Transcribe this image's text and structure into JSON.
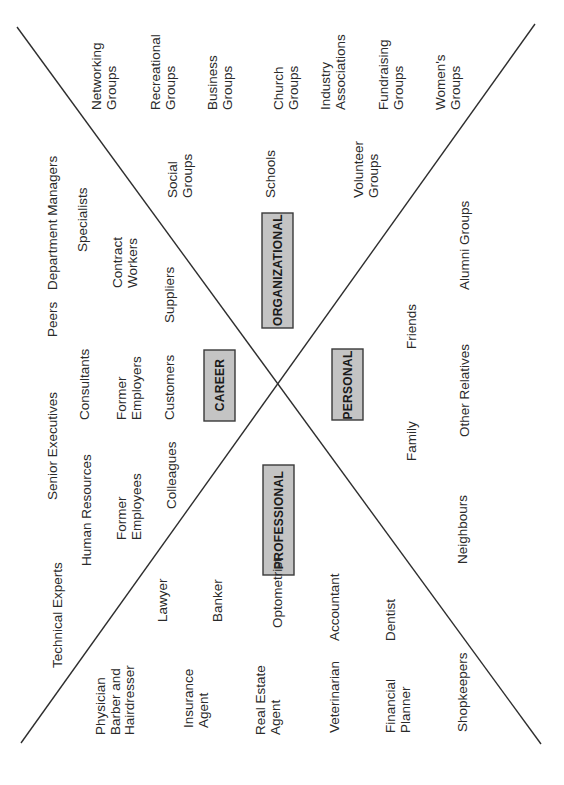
{
  "diagram": {
    "title": "",
    "orientation": "rotated-90-ccw",
    "colors": {
      "line": "#2e2e2e",
      "box_fill": "#c4c4c4",
      "box_stroke": "#3a3a3a",
      "text": "#2a2a2a",
      "background": "#ffffff"
    },
    "categories": {
      "career": "CAREER",
      "organizational": "ORGANIZATIONAL",
      "personal": "PERSONAL",
      "professional": "PROFESSIONAL"
    },
    "career": [
      {
        "lines": [
          "Technical Experts"
        ]
      },
      {
        "lines": [
          "Department Managers"
        ]
      },
      {
        "lines": [
          "Human Resources"
        ]
      },
      {
        "lines": [
          "Senior Executives"
        ]
      },
      {
        "lines": [
          "Peers"
        ]
      },
      {
        "lines": [
          "Specialists"
        ]
      },
      {
        "lines": [
          "Consultants"
        ]
      },
      {
        "lines": [
          "Former",
          "Employers"
        ]
      },
      {
        "lines": [
          "Former",
          "Employees"
        ]
      },
      {
        "lines": [
          "Contract",
          "Workers"
        ]
      },
      {
        "lines": [
          "Colleagues"
        ]
      },
      {
        "lines": [
          "Customers"
        ]
      },
      {
        "lines": [
          "Suppliers"
        ]
      }
    ],
    "organizational": [
      {
        "lines": [
          "Networking",
          "Groups"
        ]
      },
      {
        "lines": [
          "Recreational",
          "Groups"
        ]
      },
      {
        "lines": [
          "Business",
          "Groups"
        ]
      },
      {
        "lines": [
          "Church",
          "Groups"
        ]
      },
      {
        "lines": [
          "Industry",
          "Associations"
        ]
      },
      {
        "lines": [
          "Fundraising",
          "Groups"
        ]
      },
      {
        "lines": [
          "Women's",
          "Groups"
        ]
      },
      {
        "lines": [
          "Social",
          "Groups"
        ]
      },
      {
        "lines": [
          "Schools"
        ]
      },
      {
        "lines": [
          "Volunteer",
          "Groups"
        ]
      },
      {
        "lines": [
          "Alumni Groups"
        ]
      }
    ],
    "personal": [
      {
        "lines": [
          "Friends"
        ]
      },
      {
        "lines": [
          "Other Relatives"
        ]
      },
      {
        "lines": [
          "Family"
        ]
      },
      {
        "lines": [
          "Neighbours"
        ]
      }
    ],
    "professional": [
      {
        "lines": [
          "Physician",
          "Barber and",
          "Hairdresser"
        ]
      },
      {
        "lines": [
          "Lawyer"
        ]
      },
      {
        "lines": [
          "Insurance",
          "Agent"
        ]
      },
      {
        "lines": [
          "Banker"
        ]
      },
      {
        "lines": [
          "Real Estate",
          "Agent"
        ]
      },
      {
        "lines": [
          "Optometrist"
        ]
      },
      {
        "lines": [
          "Veterinarian"
        ]
      },
      {
        "lines": [
          "Accountant"
        ]
      },
      {
        "lines": [
          "Financial",
          "Planner"
        ]
      },
      {
        "lines": [
          "Dentist"
        ]
      },
      {
        "lines": [
          "Shopkeepers"
        ]
      }
    ]
  }
}
